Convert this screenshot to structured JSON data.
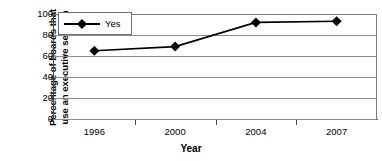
{
  "chart_data": {
    "type": "line",
    "title": "",
    "xlabel": "Year",
    "ylabel": "Percentage of boards that use an executive session",
    "ylabel_lines": [
      "Percentage of boards that",
      "use an executive session"
    ],
    "categories": [
      "1996",
      "2000",
      "2004",
      "2007"
    ],
    "series": [
      {
        "name": "Yes",
        "values": [
          65,
          69,
          92,
          93
        ],
        "marker": "diamond",
        "color": "#000000"
      }
    ],
    "ylim": [
      0,
      100
    ],
    "yticks": [
      0,
      20,
      40,
      60,
      80,
      100
    ],
    "ytick_labels": [
      "0",
      "20",
      "40",
      "60",
      "80",
      "100"
    ],
    "grid": true,
    "grid_axis": "y",
    "legend": {
      "position": "top-left",
      "entries": [
        "Yes"
      ]
    },
    "colors": {
      "series": "#000000",
      "grid": "#8d8d8d",
      "axis": "#4a4a4a",
      "background": "#ffffff"
    }
  }
}
